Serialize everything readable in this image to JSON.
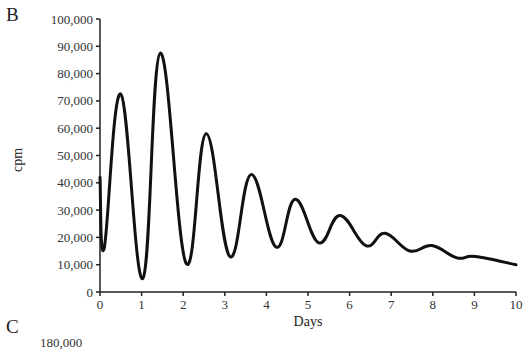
{
  "panels": {
    "b_label": "B",
    "c_label": "C",
    "c_first_tick": "180,000"
  },
  "chart_data": {
    "type": "line",
    "title": "",
    "xlabel": "Days",
    "ylabel": "cpm",
    "xlim": [
      0,
      10
    ],
    "ylim": [
      0,
      100000
    ],
    "grid": false,
    "legend": null,
    "x_ticks": [
      "0",
      "1",
      "2",
      "3",
      "4",
      "5",
      "6",
      "7",
      "8",
      "9",
      "10"
    ],
    "y_ticks": [
      "0",
      "10,000",
      "20,000",
      "30,000",
      "40,000",
      "50,000",
      "60,000",
      "70,000",
      "80,000",
      "90,000",
      "100,000"
    ],
    "series": [
      {
        "name": "cpm",
        "color": "#111111",
        "x": [
          0.0,
          0.1,
          0.5,
          1.03,
          1.45,
          2.07,
          2.55,
          3.12,
          3.63,
          4.23,
          4.69,
          5.26,
          5.77,
          6.39,
          6.85,
          7.45,
          7.98,
          8.58,
          9.02,
          10.0
        ],
        "y": [
          42000,
          16000,
          72500,
          5000,
          87500,
          10500,
          58000,
          13000,
          43000,
          16500,
          34000,
          18000,
          28000,
          17000,
          21500,
          15000,
          17000,
          12500,
          13000,
          10000
        ]
      }
    ]
  }
}
